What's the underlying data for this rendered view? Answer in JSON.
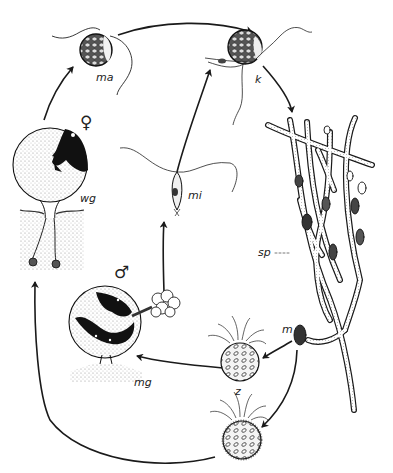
{
  "diagram": {
    "type": "life-cycle",
    "style": "black ink scientific illustration on white background",
    "colors": {
      "ink": "#1a1a1a",
      "stipple": "#888888",
      "background": "#ffffff"
    },
    "labels": {
      "ma": "ma",
      "k": "k",
      "sp": "sp",
      "m": "m",
      "z": "z",
      "mg": "mg",
      "wg": "wg",
      "mi": "mi",
      "female": "♀",
      "male": "♂",
      "sp_leader": "- - -"
    },
    "nodes": [
      {
        "id": "ma",
        "label": "ma",
        "description": "flagellated female gamete (macrogamete)"
      },
      {
        "id": "k",
        "label": "k",
        "description": "germinating zygote / fusion cell with rhizoids"
      },
      {
        "id": "sp",
        "label": "sp",
        "description": "branched sporophyte hyphae with sporangia"
      },
      {
        "id": "m",
        "label": "m",
        "description": "sporangium releasing zoospores"
      },
      {
        "id": "z",
        "label": "z",
        "description": "zoospores with flagella tuft"
      },
      {
        "id": "mg",
        "label": "mg",
        "description": "male gametangium / male gametophyte",
        "sex": "♂"
      },
      {
        "id": "wg",
        "label": "wg",
        "description": "female gametophyte",
        "sex": "♀"
      },
      {
        "id": "mi",
        "label": "mi",
        "description": "biflagellate male gamete (microgamete)"
      }
    ],
    "edges": [
      {
        "from": "wg",
        "to": "ma"
      },
      {
        "from": "ma",
        "to": "k"
      },
      {
        "from": "mi",
        "to": "k"
      },
      {
        "from": "k",
        "to": "sp"
      },
      {
        "from": "sp",
        "to": "m"
      },
      {
        "from": "m",
        "to": "z"
      },
      {
        "from": "z",
        "to": "mg"
      },
      {
        "from": "m",
        "to": "z2"
      },
      {
        "from": "z2",
        "to": "wg"
      },
      {
        "from": "mg",
        "to": "mi"
      }
    ]
  }
}
